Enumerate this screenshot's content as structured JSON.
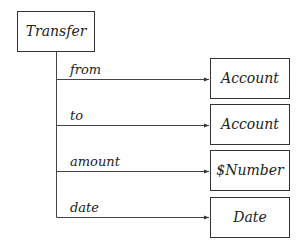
{
  "diagram": {
    "root": {
      "label": "Transfer",
      "x": 17,
      "y": 11,
      "w": 77,
      "h": 40
    },
    "trunk": {
      "x": 56,
      "y1": 51,
      "y2": 217
    },
    "edges": [
      {
        "label": "from",
        "y": 79,
        "target": {
          "label": "Account",
          "x": 210,
          "y": 58,
          "w": 79,
          "h": 40
        }
      },
      {
        "label": "to",
        "y": 125,
        "target": {
          "label": "Account",
          "x": 210,
          "y": 104,
          "w": 79,
          "h": 40
        }
      },
      {
        "label": "amount",
        "y": 171,
        "target": {
          "label": "$Number",
          "x": 210,
          "y": 150,
          "w": 79,
          "h": 40
        }
      },
      {
        "label": "date",
        "y": 217,
        "target": {
          "label": "Date",
          "x": 210,
          "y": 197,
          "w": 79,
          "h": 40
        }
      }
    ],
    "colors": {
      "stroke": "#333333",
      "text": "#222222",
      "background": "#ffffff"
    }
  }
}
